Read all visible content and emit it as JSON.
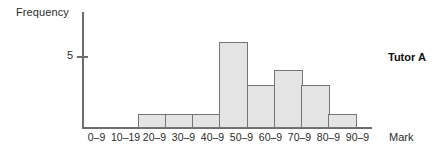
{
  "chart_data": {
    "type": "bar",
    "title": "",
    "subtitle": "",
    "xlabel": "Mark",
    "ylabel": "Frequency",
    "categories": [
      "0–9",
      "10–19",
      "20–9",
      "30–9",
      "40–9",
      "50–9",
      "60–9",
      "70–9",
      "80–9",
      "90–9"
    ],
    "values": [
      0,
      0,
      1,
      1,
      1,
      6,
      3,
      4,
      3,
      1
    ],
    "series": [
      {
        "name": "Tutor A",
        "values": [
          0,
          0,
          1,
          1,
          1,
          6,
          3,
          4,
          3,
          1
        ]
      }
    ],
    "ylim": [
      0,
      8
    ],
    "y_ticks": [
      "5"
    ],
    "y_tick_values": [
      5
    ],
    "grid": false,
    "legend": "none",
    "annotations": [
      "Tutor A"
    ],
    "bar_style": {
      "fill": "#e4e4e4",
      "stroke": "#757575"
    }
  },
  "axes": {
    "y_title": "Frequency",
    "x_title": "Mark",
    "y_tick_label_5": "5"
  },
  "annotation": {
    "series_label": "Tutor A"
  }
}
